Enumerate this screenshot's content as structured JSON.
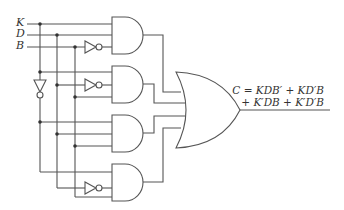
{
  "diagram": {
    "type": "logic-circuit",
    "inputs": [
      {
        "name": "K",
        "label": "K"
      },
      {
        "name": "D",
        "label": "D"
      },
      {
        "name": "B",
        "label": "B"
      }
    ],
    "gates": [
      {
        "id": "and1",
        "type": "AND",
        "inputs": [
          "K",
          "D",
          "B'"
        ]
      },
      {
        "id": "and2",
        "type": "AND",
        "inputs": [
          "K",
          "D'",
          "B"
        ]
      },
      {
        "id": "and3",
        "type": "AND",
        "inputs": [
          "K'",
          "D",
          "B"
        ]
      },
      {
        "id": "and4",
        "type": "AND",
        "inputs": [
          "K'",
          "D'",
          "B"
        ]
      },
      {
        "id": "or1",
        "type": "OR",
        "inputs": [
          "and1",
          "and2",
          "and3",
          "and4"
        ]
      }
    ],
    "output": {
      "line1": "C = KDB′ + KD′B",
      "line2": "+ K′DB + K′D′B"
    }
  }
}
